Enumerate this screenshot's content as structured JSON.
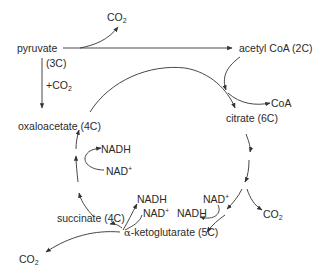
{
  "diagram": {
    "stroke_color": "#333333",
    "text_color": "#2a2a2a",
    "nodes": {
      "co2_top": {
        "base": "CO",
        "sub": "2"
      },
      "pyruvate": "pyruvate",
      "pyruvate_carbons": "(3C)",
      "plus_co2": {
        "prefix": "+CO",
        "sub": "2"
      },
      "acetyl_coa": "acetyl CoA (2C)",
      "coa": "CoA",
      "citrate": "citrate (6C)",
      "oxaloacetate": "oxaloacetate (4C)",
      "nadh_left": "NADH",
      "nad_left": {
        "base": "NAD",
        "sup": "+"
      },
      "nadh_mid": "NADH",
      "nad_mid": {
        "base": "NAD",
        "sup": "+"
      },
      "nad_right": {
        "base": "NAD",
        "sup": "+"
      },
      "nadh_right": "NADH",
      "co2_right": {
        "base": "CO",
        "sub": "2"
      },
      "succinate": "succinate (4C)",
      "alpha_ketoglutarate": {
        "alpha": "α",
        "rest": "-ketoglutarate (5C)"
      },
      "co2_bottom": {
        "base": "CO",
        "sub": "2"
      }
    }
  }
}
